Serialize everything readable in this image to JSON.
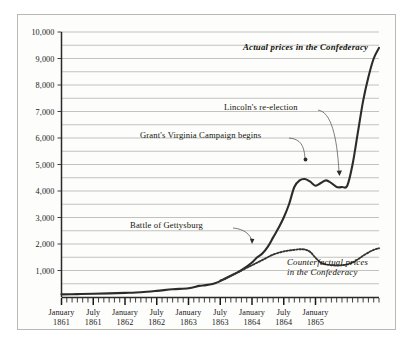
{
  "chart_data": {
    "type": "line",
    "title": "",
    "subtitle": "",
    "xlabel": "",
    "ylabel": "",
    "ylim": [
      0,
      10000
    ],
    "ytick_values": [
      0,
      1000,
      2000,
      3000,
      4000,
      5000,
      6000,
      7000,
      8000,
      9000,
      10000
    ],
    "ytick_labels": [
      "",
      "1,000",
      "2,000",
      "3,000",
      "4,000",
      "5,000",
      "6,000",
      "7,000",
      "8,000",
      "9,000",
      "10,000"
    ],
    "minor_gridline_step": 500,
    "grid": true,
    "legend_position": "inline-annotations",
    "x_axis": {
      "type": "monthly",
      "start": "1861-01",
      "end": "1865-04",
      "tick_labels": [
        {
          "line1": "January",
          "line2": "1861",
          "month_index": 0
        },
        {
          "line1": "July",
          "line2": "1861",
          "month_index": 6
        },
        {
          "line1": "January",
          "line2": "1862",
          "month_index": 12
        },
        {
          "line1": "July",
          "line2": "1862",
          "month_index": 18
        },
        {
          "line1": "January",
          "line2": "1863",
          "month_index": 24
        },
        {
          "line1": "July",
          "line2": "1863",
          "month_index": 30
        },
        {
          "line1": "January",
          "line2": "1864",
          "month_index": 36
        },
        {
          "line1": "July",
          "line2": "1864",
          "month_index": 42
        },
        {
          "line1": "January",
          "line2": "1865",
          "month_index": 48
        }
      ]
    },
    "series": [
      {
        "name": "Actual prices in the Confederacy",
        "style": "solid",
        "label_style": "bold-italic",
        "points": [
          [
            0,
            100
          ],
          [
            3,
            110
          ],
          [
            6,
            120
          ],
          [
            9,
            135
          ],
          [
            12,
            155
          ],
          [
            15,
            180
          ],
          [
            18,
            230
          ],
          [
            21,
            290
          ],
          [
            24,
            330
          ],
          [
            26,
            420
          ],
          [
            27,
            440
          ],
          [
            28,
            470
          ],
          [
            29,
            520
          ],
          [
            30,
            600
          ],
          [
            31,
            700
          ],
          [
            32,
            800
          ],
          [
            33,
            900
          ],
          [
            34,
            1010
          ],
          [
            35,
            1150
          ],
          [
            36,
            1300
          ],
          [
            37,
            1500
          ],
          [
            38,
            1650
          ],
          [
            39,
            1900
          ],
          [
            40,
            2250
          ],
          [
            41,
            2600
          ],
          [
            42,
            3000
          ],
          [
            43,
            3500
          ],
          [
            44,
            4150
          ],
          [
            45,
            4400
          ],
          [
            46,
            4450
          ],
          [
            47,
            4350
          ],
          [
            48,
            4200
          ],
          [
            49,
            4300
          ],
          [
            50,
            4400
          ],
          [
            51,
            4300
          ],
          [
            52,
            4150
          ],
          [
            53,
            4150
          ],
          [
            54,
            4200
          ],
          [
            55,
            5000
          ],
          [
            56,
            6200
          ],
          [
            57,
            7400
          ],
          [
            58,
            8300
          ],
          [
            59,
            9000
          ],
          [
            60,
            9400
          ]
        ]
      },
      {
        "name": "Counterfactual prices in the Confederacy",
        "style": "dotted",
        "label_style": "italic",
        "points": [
          [
            30,
            620
          ],
          [
            32,
            800
          ],
          [
            34,
            1000
          ],
          [
            36,
            1200
          ],
          [
            38,
            1400
          ],
          [
            40,
            1600
          ],
          [
            42,
            1720
          ],
          [
            44,
            1780
          ],
          [
            45,
            1800
          ],
          [
            46,
            1790
          ],
          [
            47,
            1700
          ],
          [
            48,
            1480
          ],
          [
            49,
            1300
          ],
          [
            50,
            1230
          ],
          [
            51,
            1200
          ],
          [
            52,
            1190
          ],
          [
            53,
            1200
          ],
          [
            54,
            1230
          ],
          [
            55,
            1300
          ],
          [
            56,
            1420
          ],
          [
            57,
            1560
          ],
          [
            58,
            1680
          ],
          [
            59,
            1780
          ],
          [
            60,
            1840
          ]
        ]
      }
    ],
    "annotations": [
      {
        "id": "gettysburg",
        "text": "Battle of Gettysburg",
        "target_month": 30,
        "target_value": 640
      },
      {
        "id": "grant",
        "text": "Grant's Virginia Campaign begins",
        "target_month": 44,
        "target_value": 4200
      },
      {
        "id": "lincoln",
        "text": "Lincoln's re-election",
        "target_month": 53,
        "target_value": 4150
      }
    ],
    "series_labels": [
      {
        "id": "actual-label",
        "text": "Actual prices in the Confederacy"
      },
      {
        "id": "counterfactual-label",
        "line1": "Counterfactual prices",
        "line2": "in the Confederacy"
      }
    ],
    "colors": {
      "background": "#fdfdfc",
      "frame": "#b9b9b4",
      "gridline": "#9a9a95",
      "axis": "#2a2a28",
      "series_actual": "#2c2c2a",
      "series_counterfactual": "#35352f",
      "text": "#1a1a1a"
    }
  }
}
